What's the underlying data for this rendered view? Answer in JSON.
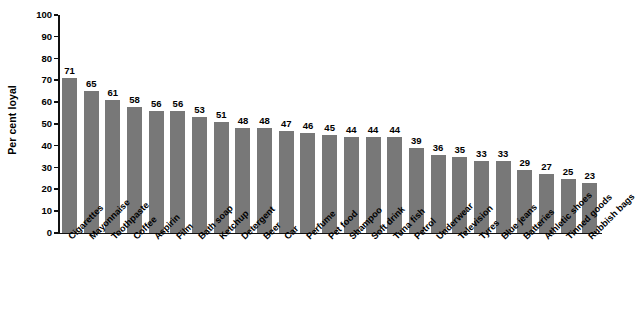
{
  "chart_data": {
    "type": "bar",
    "title": "",
    "subtitle": "",
    "xlabel": "",
    "ylabel": "Per cent loyal",
    "ylim": [
      0,
      100
    ],
    "ytick_step": 10,
    "yticks": [
      100,
      90,
      80,
      70,
      60,
      50,
      40,
      30,
      20,
      10,
      0
    ],
    "grid": false,
    "legend": null,
    "legend_position": "none",
    "bar_color": "#787878",
    "axis_color": "#111111",
    "value_labels_shown": true,
    "categories": [
      "Cigarettes",
      "Mayonnaise",
      "Toothpaste",
      "Coffee",
      "Aspirin",
      "Film",
      "Bath soap",
      "Ketchup",
      "Detergent",
      "Beer",
      "Car",
      "Perfume",
      "Pet food",
      "Shampoo",
      "Soft drink",
      "Tuna fish",
      "Petrol",
      "Underwear",
      "Television",
      "Tyres",
      "Blue jeans",
      "Batteries",
      "Athletic shoes",
      "Tinned goods",
      "Rubbish bags"
    ],
    "values": [
      71,
      65,
      61,
      58,
      56,
      56,
      53,
      51,
      48,
      48,
      47,
      46,
      45,
      44,
      44,
      44,
      39,
      36,
      35,
      33,
      33,
      29,
      27,
      25,
      23
    ]
  }
}
